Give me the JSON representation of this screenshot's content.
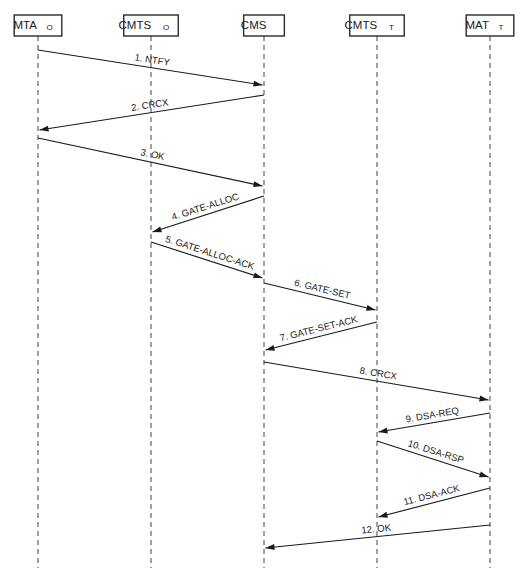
{
  "diagram": {
    "type": "sequence-diagram",
    "width": 529,
    "height": 580,
    "background_color": "#ffffff",
    "line_color": "#1a1a1a",
    "lifeline_color": "#8a8a8a",
    "participants": [
      {
        "id": "mta_o",
        "base": "MTA",
        "subscript": "O",
        "x": 38
      },
      {
        "id": "cmts_o",
        "base": "CMTS",
        "subscript": "O",
        "x": 151
      },
      {
        "id": "cms",
        "base": "CMS",
        "subscript": "",
        "x": 264
      },
      {
        "id": "cmts_t",
        "base": "CMTS",
        "subscript": "T",
        "x": 377
      },
      {
        "id": "mat_t",
        "base": "MAT",
        "subscript": "T",
        "x": 490
      }
    ],
    "box": {
      "top": 15,
      "height": 21
    },
    "lifeline": {
      "top": 36,
      "bottom": 568
    },
    "messages": [
      {
        "number": "1.",
        "name": "NTFY",
        "label": "1. NTFY",
        "from": 0,
        "to": 2,
        "y1": 50,
        "y2": 85
      },
      {
        "number": "2.",
        "name": "CRCX",
        "label": "2. CRCX",
        "from": 2,
        "to": 0,
        "y1": 95,
        "y2": 130
      },
      {
        "number": "3.",
        "name": "OK",
        "label": "3. OK",
        "from": 0,
        "to": 2,
        "y1": 138,
        "y2": 186
      },
      {
        "number": "4.",
        "name": "GATE-ALLOC",
        "label": "4. GATE-ALLOC",
        "from": 2,
        "to": 1,
        "y1": 196,
        "y2": 232
      },
      {
        "number": "5.",
        "name": "GATE-ALLOC-ACK",
        "label": "5. GATE-ALLOC-ACK",
        "from": 1,
        "to": 2,
        "y1": 242,
        "y2": 278
      },
      {
        "number": "6.",
        "name": "GATE-SET",
        "label": "6. GATE-SET",
        "from": 2,
        "to": 3,
        "y1": 283,
        "y2": 310
      },
      {
        "number": "7.",
        "name": "GATE-SET-ACK",
        "label": "7. GATE-SET-ACK",
        "from": 3,
        "to": 2,
        "y1": 322,
        "y2": 350
      },
      {
        "number": "8.",
        "name": "CRCX",
        "label": "8. CRCX",
        "from": 2,
        "to": 4,
        "y1": 362,
        "y2": 400
      },
      {
        "number": "9.",
        "name": "DSA-REQ",
        "label": "9. DSA-REQ",
        "from": 4,
        "to": 3,
        "y1": 413,
        "y2": 432
      },
      {
        "number": "10.",
        "name": "DSA-RSP",
        "label": "10. DSA-RSP",
        "from": 3,
        "to": 4,
        "y1": 441,
        "y2": 477
      },
      {
        "number": "11.",
        "name": "DSA-ACK",
        "label": "11. DSA-ACK",
        "from": 4,
        "to": 3,
        "y1": 488,
        "y2": 517
      },
      {
        "number": "12.",
        "name": "OK",
        "label": "12. OK",
        "from": 4,
        "to": 2,
        "y1": 525,
        "y2": 548
      }
    ]
  }
}
